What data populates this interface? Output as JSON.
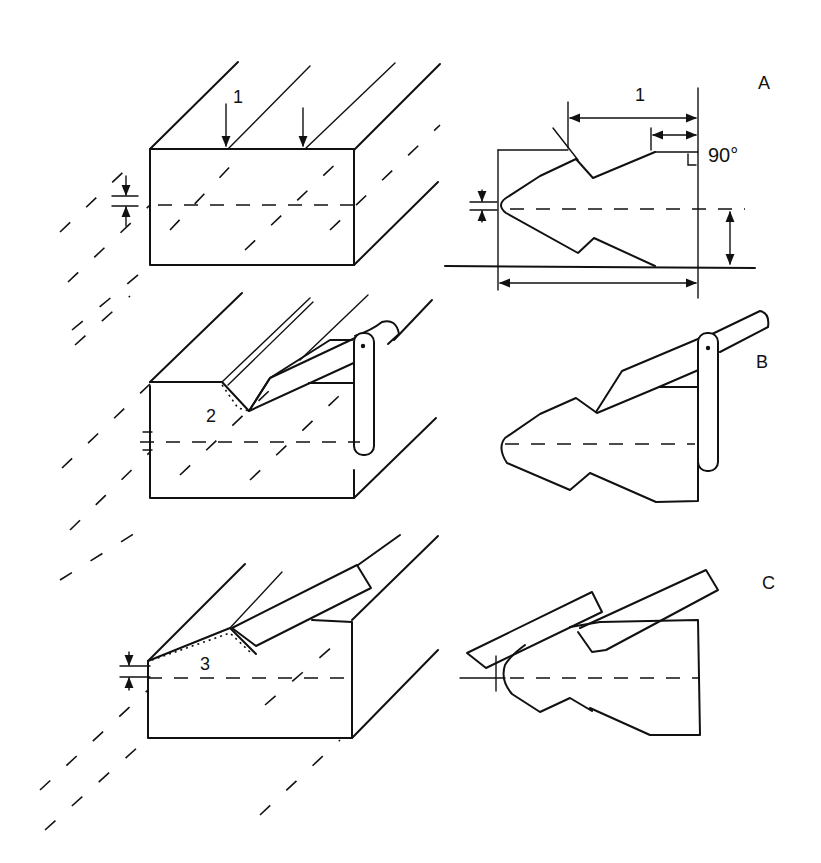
{
  "figure": {
    "rows": [
      {
        "id": "A",
        "label": "A",
        "step_label": "1",
        "right_annotation": "90°",
        "dimension_label": "1"
      },
      {
        "id": "B",
        "label": "B",
        "step_label": "2"
      },
      {
        "id": "C",
        "label": "C",
        "step_label": "3"
      }
    ],
    "colors": {
      "line": "#111111",
      "background": "#ffffff"
    }
  }
}
